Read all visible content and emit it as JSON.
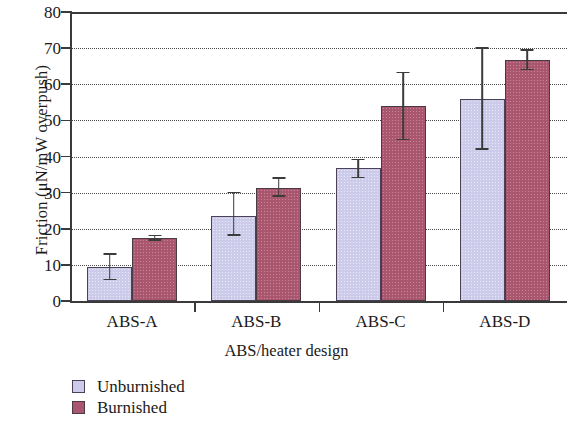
{
  "chart_data": {
    "type": "bar",
    "title": "",
    "xlabel": "ABS/heater design",
    "ylabel": "Friction (μN/mW overpush)",
    "categories": [
      "ABS-A",
      "ABS-B",
      "ABS-C",
      "ABS-D"
    ],
    "ylim": [
      0,
      80
    ],
    "yticks": [
      0,
      10,
      20,
      30,
      40,
      50,
      60,
      70,
      80
    ],
    "grid": "horizontal-dotted",
    "legend_position": "below-axes-left",
    "series": [
      {
        "name": "Unburnished",
        "color": "#ccccea",
        "values": [
          9.5,
          23.5,
          36.7,
          56.0
        ],
        "errors_up": [
          3.5,
          6.5,
          2.5,
          14.0
        ],
        "errors_down": [
          3.5,
          5.2,
          2.5,
          14.0
        ]
      },
      {
        "name": "Burnished",
        "color": "#a9566e",
        "values": [
          17.5,
          31.2,
          54.0,
          66.8
        ],
        "errors_up": [
          0.6,
          2.8,
          9.3,
          2.7
        ],
        "errors_down": [
          0.6,
          2.2,
          9.3,
          2.7
        ]
      }
    ]
  },
  "axes": {
    "y_tick_labels": [
      "0",
      "10",
      "20",
      "30",
      "40",
      "50",
      "60",
      "70",
      "80"
    ],
    "y_axis_title": "Friction (μN/mW overpush)",
    "x_axis_title": "ABS/heater design",
    "x_tick_labels": [
      "ABS-A",
      "ABS-B",
      "ABS-C",
      "ABS-D"
    ]
  },
  "legend": {
    "items": [
      {
        "label": "Unburnished",
        "color": "#ccccea"
      },
      {
        "label": "Burnished",
        "color": "#a9566e"
      }
    ]
  }
}
